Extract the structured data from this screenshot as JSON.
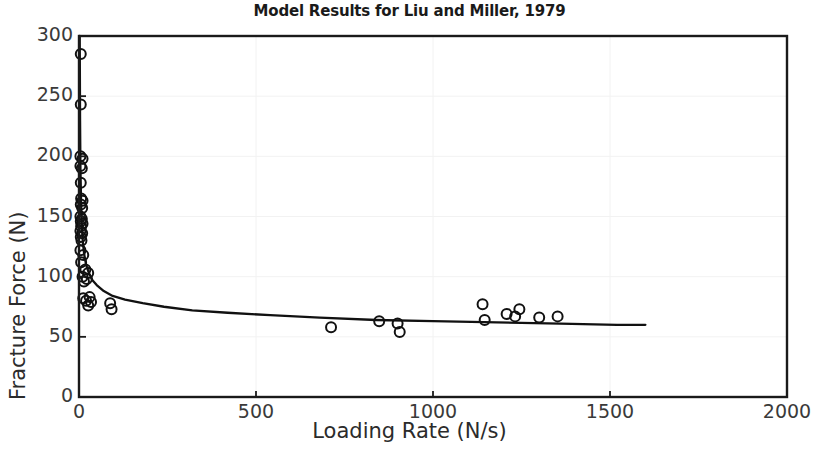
{
  "chart_data": {
    "type": "scatter",
    "title": "Model Results for Liu and Miller, 1979",
    "xlabel": "Loading Rate (N/s)",
    "ylabel": "Fracture Force (N)",
    "xlim": [
      0,
      2000
    ],
    "ylim": [
      0,
      300
    ],
    "xticks": [
      0,
      500,
      1000,
      1500,
      2000
    ],
    "yticks": [
      0,
      50,
      100,
      150,
      200,
      250,
      300
    ],
    "grid": true,
    "legend": null,
    "series": [
      {
        "name": "Experimental data",
        "type": "scatter",
        "marker": "open-circle",
        "points": [
          [
            5,
            285
          ],
          [
            5,
            243
          ],
          [
            4,
            200
          ],
          [
            10,
            198
          ],
          [
            4,
            192
          ],
          [
            8,
            190
          ],
          [
            5,
            178
          ],
          [
            6,
            165
          ],
          [
            10,
            163
          ],
          [
            5,
            160
          ],
          [
            9,
            157
          ],
          [
            4,
            150
          ],
          [
            8,
            148
          ],
          [
            5,
            146
          ],
          [
            10,
            144
          ],
          [
            6,
            142
          ],
          [
            4,
            138
          ],
          [
            9,
            136
          ],
          [
            5,
            133
          ],
          [
            7,
            130
          ],
          [
            4,
            122
          ],
          [
            12,
            118
          ],
          [
            6,
            112
          ],
          [
            18,
            106
          ],
          [
            26,
            103
          ],
          [
            10,
            100
          ],
          [
            22,
            98
          ],
          [
            14,
            96
          ],
          [
            12,
            82
          ],
          [
            20,
            80
          ],
          [
            30,
            83
          ],
          [
            34,
            79
          ],
          [
            26,
            76
          ],
          [
            88,
            78
          ],
          [
            92,
            73
          ],
          [
            712,
            58
          ],
          [
            848,
            63
          ],
          [
            900,
            61
          ],
          [
            906,
            54
          ],
          [
            1140,
            77
          ],
          [
            1146,
            64
          ],
          [
            1208,
            69
          ],
          [
            1232,
            67
          ],
          [
            1244,
            73
          ],
          [
            1300,
            66
          ],
          [
            1352,
            67
          ]
        ]
      },
      {
        "name": "Model fit",
        "type": "line",
        "points": [
          [
            2,
            300
          ],
          [
            3,
            230
          ],
          [
            4,
            190
          ],
          [
            6,
            160
          ],
          [
            8,
            142
          ],
          [
            11,
            128
          ],
          [
            15,
            118
          ],
          [
            20,
            110
          ],
          [
            28,
            103
          ],
          [
            38,
            97
          ],
          [
            50,
            93
          ],
          [
            70,
            88
          ],
          [
            95,
            84
          ],
          [
            130,
            81
          ],
          [
            180,
            78
          ],
          [
            240,
            75
          ],
          [
            320,
            72
          ],
          [
            420,
            70
          ],
          [
            540,
            68
          ],
          [
            680,
            66
          ],
          [
            840,
            64
          ],
          [
            1000,
            63
          ],
          [
            1180,
            62
          ],
          [
            1360,
            61
          ],
          [
            1520,
            60
          ],
          [
            1600,
            60
          ]
        ]
      }
    ]
  },
  "figure": {
    "background_color": "#ffffff",
    "axes_color": "#1a1a1a",
    "grid_color": "#f2f2f2",
    "marker_edge_color": "#111111",
    "line_color": "#111111"
  }
}
